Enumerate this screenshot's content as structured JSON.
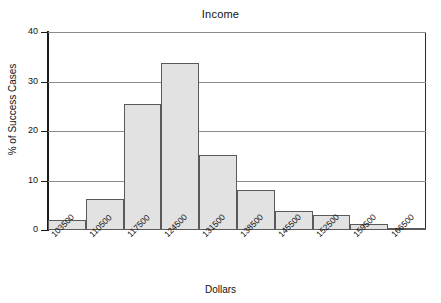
{
  "chart_data": {
    "type": "bar",
    "title": "Income",
    "xlabel": "Dollars",
    "ylabel": "% of Success Cases",
    "categories": [
      "103500",
      "110500",
      "117500",
      "124500",
      "131500",
      "138500",
      "145500",
      "152500",
      "159500",
      "166500"
    ],
    "values": [
      2.0,
      6.3,
      25.5,
      33.8,
      15.2,
      8.0,
      3.8,
      3.0,
      1.3,
      0.3
    ],
    "ylim": [
      0,
      40
    ],
    "yticks": [
      0,
      10,
      20,
      30,
      40
    ],
    "ytick_labels": [
      "0",
      "10",
      "20",
      "30",
      "40"
    ],
    "grid": true,
    "legend": "none",
    "bar_fill": "#e2e2e2",
    "bar_edge": "#5a5a5a",
    "axis_color": "#1a1a1a",
    "grid_color": "#8c8c8c"
  }
}
